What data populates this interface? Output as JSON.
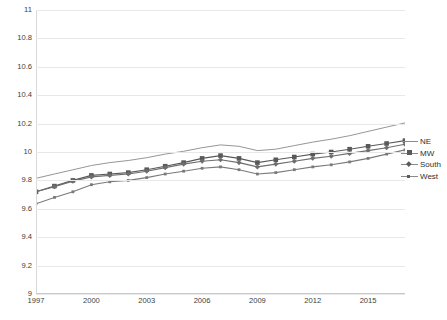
{
  "chart_data": {
    "type": "line",
    "title": "",
    "xlabel": "",
    "ylabel": "LOG OF REAL PER CAPITA PCE (1989 DOLARS)",
    "ylim": [
      9,
      11
    ],
    "ytick_step": 0.2,
    "yticks": [
      "11",
      "10.8",
      "10.6",
      "10.4",
      "10.2",
      "10",
      "9.8",
      "9.6",
      "9.4",
      "9.2",
      "9"
    ],
    "xlim": [
      1997,
      2017
    ],
    "xticks": [
      "1997",
      "2000",
      "2003",
      "2006",
      "2009",
      "2012",
      "2015"
    ],
    "xtick_values": [
      1997,
      2000,
      2003,
      2006,
      2009,
      2012,
      2015
    ],
    "x": [
      1997,
      1998,
      1999,
      2000,
      2001,
      2002,
      2003,
      2004,
      2005,
      2006,
      2007,
      2008,
      2009,
      2010,
      2011,
      2012,
      2013,
      2014,
      2015,
      2016,
      2017
    ],
    "grid": true,
    "legend_position": "right",
    "series": [
      {
        "name": "NE",
        "marker": "none",
        "color": "#8a8a8a",
        "values": [
          9.815,
          9.845,
          9.875,
          9.905,
          9.925,
          9.94,
          9.96,
          9.985,
          10.005,
          10.03,
          10.05,
          10.04,
          10.01,
          10.02,
          10.045,
          10.07,
          10.09,
          10.115,
          10.145,
          10.175,
          10.205
        ]
      },
      {
        "name": "MW",
        "marker": "square",
        "color": "#595959",
        "values": [
          9.72,
          9.76,
          9.8,
          9.835,
          9.845,
          9.855,
          9.875,
          9.9,
          9.925,
          9.955,
          9.975,
          9.955,
          9.925,
          9.945,
          9.965,
          9.985,
          10.0,
          10.02,
          10.04,
          10.06,
          10.08
        ]
      },
      {
        "name": "South",
        "marker": "diamond",
        "color": "#6e6e6e",
        "values": [
          9.72,
          9.755,
          9.795,
          9.825,
          9.835,
          9.845,
          9.865,
          9.89,
          9.915,
          9.935,
          9.945,
          9.925,
          9.895,
          9.915,
          9.935,
          9.955,
          9.97,
          9.99,
          10.01,
          10.03,
          10.055
        ]
      },
      {
        "name": "West",
        "marker": "cross",
        "color": "#7a7a7a",
        "values": [
          9.635,
          9.68,
          9.72,
          9.77,
          9.79,
          9.8,
          9.82,
          9.845,
          9.865,
          9.885,
          9.895,
          9.875,
          9.845,
          9.855,
          9.875,
          9.895,
          9.91,
          9.93,
          9.955,
          9.985,
          10.015
        ]
      }
    ]
  },
  "legend": {
    "items": [
      {
        "label": "NE"
      },
      {
        "label": "MW"
      },
      {
        "label": "South"
      },
      {
        "label": "West"
      }
    ]
  }
}
